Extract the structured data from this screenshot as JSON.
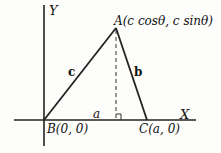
{
  "diagram": {
    "axes": {
      "x_label": "X",
      "y_label": "Y"
    },
    "points": {
      "A": "A(c cosθ, c sinθ)",
      "B": "B(0, 0)",
      "C": "C(a, 0)"
    },
    "sides": {
      "a": "a",
      "b": "b",
      "c": "c"
    },
    "annotations": [
      "dashed altitude from A to BC",
      "right-angle marker at foot of altitude"
    ]
  }
}
